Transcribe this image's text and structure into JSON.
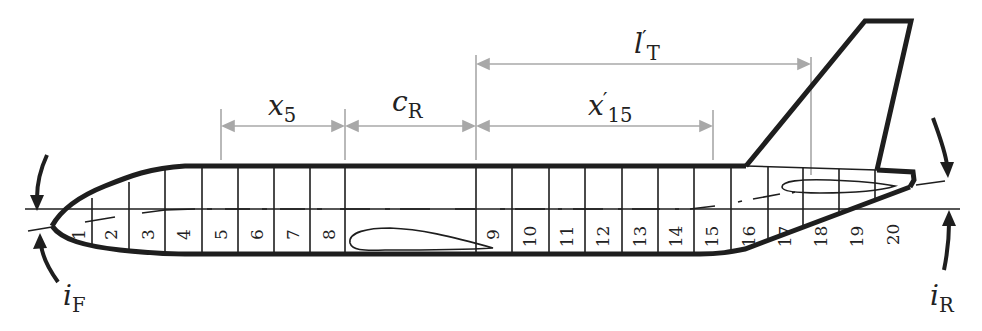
{
  "figure": {
    "dimensions": [
      {
        "id": "x5",
        "symbol": "x",
        "subscript": "5",
        "prime": false
      },
      {
        "id": "cR",
        "symbol": "c",
        "subscript": "R",
        "prime": false
      },
      {
        "id": "x15p",
        "symbol": "x",
        "subscript": "15",
        "prime": true
      },
      {
        "id": "lTp",
        "symbol": "l",
        "subscript": "T",
        "prime": true
      }
    ],
    "angles": [
      {
        "id": "iF",
        "symbol": "i",
        "subscript": "F"
      },
      {
        "id": "iR",
        "symbol": "i",
        "subscript": "R"
      }
    ],
    "segments": [
      "1",
      "2",
      "3",
      "4",
      "5",
      "6",
      "7",
      "8",
      "9",
      "10",
      "11",
      "12",
      "13",
      "14",
      "15",
      "16",
      "17",
      "18",
      "19",
      "20"
    ],
    "colors": {
      "outline": "#1e1e1e",
      "dimension": "#a8a8a8",
      "text": "#222222",
      "background": "#ffffff"
    }
  }
}
